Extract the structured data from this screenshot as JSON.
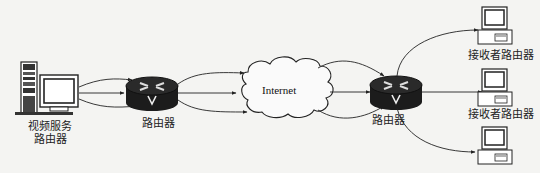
{
  "diagram": {
    "type": "network-topology",
    "nodes": {
      "video_server": {
        "label_line1": "视频服务",
        "label_line2": "路由器",
        "kind": "server-with-monitor"
      },
      "router_left": {
        "label": "路由器",
        "kind": "router"
      },
      "internet": {
        "label": "Internet",
        "kind": "cloud"
      },
      "router_right": {
        "label": "路由器",
        "kind": "router"
      },
      "receiver_top": {
        "label": "接收者路由器",
        "kind": "desktop-computer"
      },
      "receiver_middle": {
        "label": "接收者路由器",
        "kind": "desktop-computer"
      },
      "receiver_bottom": {
        "label": "",
        "kind": "desktop-computer"
      }
    },
    "edges": [
      {
        "from": "video_server",
        "to": "router_left",
        "count": 3
      },
      {
        "from": "router_left",
        "to": "internet",
        "count": 3
      },
      {
        "from": "internet",
        "to": "router_right",
        "count": 3
      },
      {
        "from": "router_right",
        "to": "receiver_top",
        "count": 1
      },
      {
        "from": "router_right",
        "to": "receiver_middle",
        "count": 1
      },
      {
        "from": "router_right",
        "to": "receiver_bottom",
        "count": 1
      }
    ],
    "colors": {
      "background": "#f4f4f2",
      "router_fill": "#1c1c1c",
      "line": "#222222"
    }
  }
}
